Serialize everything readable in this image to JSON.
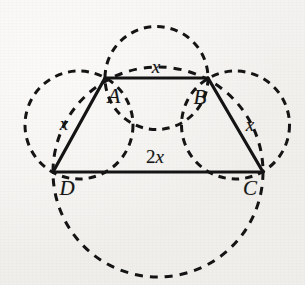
{
  "figure": {
    "type": "geometry-diagram",
    "background_color": "#f3f2ef",
    "stroke_color": "#141414",
    "solid_stroke_width": 3,
    "dashed_stroke_width": 3,
    "dash_pattern": "7 6",
    "vertices": [
      {
        "name": "A",
        "label": "A",
        "x": 105,
        "y": 78,
        "label_x": 114,
        "label_y": 96
      },
      {
        "name": "B",
        "label": "B",
        "x": 208,
        "y": 78,
        "label_x": 200,
        "label_y": 97
      },
      {
        "name": "C",
        "label": "C",
        "x": 263,
        "y": 172,
        "label_x": 250,
        "label_y": 188
      },
      {
        "name": "D",
        "label": "D",
        "x": 53,
        "y": 172,
        "label_x": 67,
        "label_y": 188
      }
    ],
    "sides": [
      {
        "name": "AB",
        "from": "A",
        "to": "B",
        "label": "x",
        "label_x": 156,
        "label_y": 66
      },
      {
        "name": "BC",
        "from": "B",
        "to": "C",
        "label": "x",
        "label_x": 250,
        "label_y": 124
      },
      {
        "name": "CD",
        "from": "C",
        "to": "D",
        "label": "2x",
        "label_x": 155,
        "label_y": 156,
        "label_prefix": "2",
        "label_var": "x"
      },
      {
        "name": "DA",
        "from": "D",
        "to": "A",
        "label": "x",
        "label_x": 64,
        "label_y": 123
      }
    ],
    "circles": [
      {
        "name": "circle-on-AB",
        "cx": 156.5,
        "cy": 78,
        "r": 51.5,
        "style": "dashed"
      },
      {
        "name": "circle-on-DA",
        "cx": 79,
        "cy": 125,
        "r": 54,
        "style": "dashed"
      },
      {
        "name": "circle-on-BC",
        "cx": 235.5,
        "cy": 125,
        "r": 54,
        "style": "dashed"
      },
      {
        "name": "circle-on-DC",
        "cx": 158,
        "cy": 172,
        "r": 105,
        "style": "dashed"
      }
    ],
    "labels": {
      "top_side": "x",
      "left_side": "x",
      "right_side": "x",
      "bottom_side": "2x",
      "vertex_a": "A",
      "vertex_b": "B",
      "vertex_c": "C",
      "vertex_d": "D"
    }
  }
}
